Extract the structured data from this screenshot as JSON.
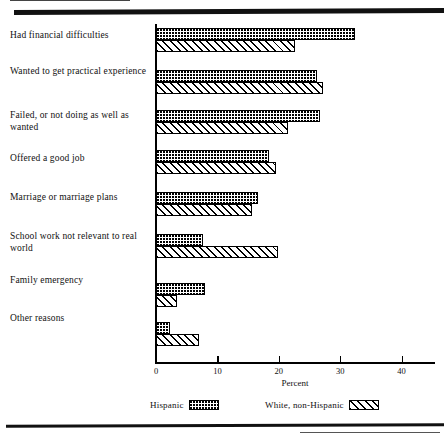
{
  "chart_data": {
    "type": "bar",
    "orientation": "horizontal",
    "title": "",
    "xlabel": "Percent",
    "ylabel": "",
    "xlim": [
      0,
      43
    ],
    "ticks": [
      0,
      10,
      20,
      30,
      40
    ],
    "tick_labels": [
      "0",
      "10",
      "20",
      "30",
      "40"
    ],
    "grid": false,
    "legend_position": "bottom",
    "categories": [
      "Had financial difficulties",
      "Wanted to get practical experience",
      "Failed, or not doing as well as wanted",
      "Offered a good job",
      "Marriage or marriage plans",
      "School work not relevant to real world",
      "Family emergency",
      "Other reasons"
    ],
    "series": [
      {
        "name": "Hispanic",
        "pattern": "dotted",
        "values": [
          32.4,
          26.2,
          26.7,
          18.4,
          16.6,
          7.7,
          8.0,
          2.3
        ]
      },
      {
        "name": "White, non-Hispanic",
        "pattern": "diagonal-hatch",
        "values": [
          22.6,
          27.2,
          21.5,
          19.5,
          15.6,
          19.9,
          3.4,
          7.0
        ]
      }
    ]
  },
  "axis": {
    "x_title": "Percent"
  },
  "legend": {
    "items": [
      {
        "label": "Hispanic",
        "pattern": "dotted"
      },
      {
        "label": "White, non-Hispanic",
        "pattern": "diagonal-hatch"
      }
    ]
  }
}
